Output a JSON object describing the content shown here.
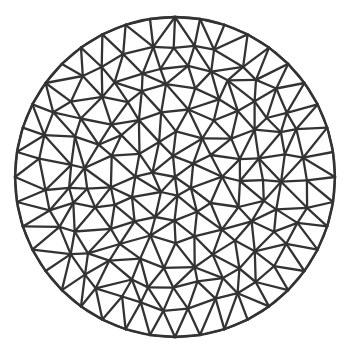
{
  "diagram": {
    "type": "triangulated-mesh",
    "shape": "circle",
    "center": [
      175,
      177
    ],
    "radius": 160,
    "stroke_color": "#333333",
    "stroke_width": 2.3,
    "background": "#ffffff",
    "rings": [
      {
        "r": 0,
        "count": 1,
        "phase": 0
      },
      {
        "r": 22,
        "count": 6,
        "phase": 0.3
      },
      {
        "r": 44,
        "count": 12,
        "phase": 0.1
      },
      {
        "r": 66,
        "count": 17,
        "phase": 0.25
      },
      {
        "r": 88,
        "count": 23,
        "phase": 0.05
      },
      {
        "r": 110,
        "count": 29,
        "phase": 0.2
      },
      {
        "r": 132,
        "count": 35,
        "phase": 0.12
      },
      {
        "r": 160,
        "count": 40,
        "phase": 0.0
      }
    ],
    "jitter": 5,
    "seed": 7
  }
}
